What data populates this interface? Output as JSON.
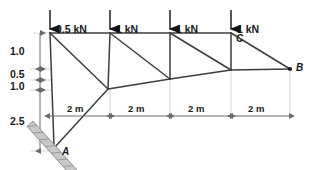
{
  "figure": {
    "type": "truss-free-body-diagram",
    "colors": {
      "member": "#3d3d3d",
      "load_arrow": "#111111",
      "dimension": "#6b6b6b",
      "text": "#1a1a1a",
      "hatch": "#9a9a9a",
      "background": "#ffffff"
    }
  },
  "loads": [
    {
      "label": "0.5 kN",
      "x": 50
    },
    {
      "label": "1 kN",
      "x": 110
    },
    {
      "label": "1 kN",
      "x": 170
    },
    {
      "label": "1 kN",
      "x": 231
    }
  ],
  "nodes": [
    {
      "name": "A",
      "label": "A",
      "x": 55,
      "y": 147
    },
    {
      "name": "B",
      "label": "B",
      "x": 290,
      "y": 69
    },
    {
      "name": "C",
      "label": "C",
      "x": 231,
      "y": 33
    }
  ],
  "vertical_dimensions": [
    {
      "label": "1.0",
      "top": 33,
      "bottom": 69
    },
    {
      "label": "0.5",
      "top": 69,
      "bottom": 80
    },
    {
      "label": "1.0",
      "top": 80,
      "bottom": 90
    },
    {
      "label": "2.5",
      "top": 90,
      "bottom": 151
    }
  ],
  "horizontal_dimensions": [
    {
      "label": "2 m",
      "left": 50,
      "right": 110
    },
    {
      "label": "2 m",
      "left": 110,
      "right": 170
    },
    {
      "label": "2 m",
      "left": 170,
      "right": 231
    },
    {
      "label": "2 m",
      "left": 231,
      "right": 290
    }
  ],
  "support": {
    "at_node": "A",
    "kind": "inclined-pin-hatched-surface"
  }
}
